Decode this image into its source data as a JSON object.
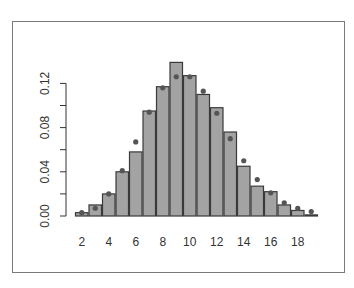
{
  "chart_data": {
    "type": "bar",
    "title": "",
    "xlabel": "",
    "ylabel": "",
    "categories": [
      2,
      3,
      4,
      5,
      6,
      7,
      8,
      9,
      10,
      11,
      12,
      13,
      14,
      15,
      16,
      17,
      18,
      19
    ],
    "series": [
      {
        "name": "observed",
        "kind": "bar",
        "values": [
          0.003,
          0.01,
          0.02,
          0.04,
          0.058,
          0.095,
          0.117,
          0.139,
          0.127,
          0.11,
          0.098,
          0.076,
          0.045,
          0.027,
          0.022,
          0.01,
          0.005,
          0.001
        ]
      },
      {
        "name": "expected",
        "kind": "point",
        "values": [
          0.003,
          0.007,
          0.02,
          0.041,
          0.067,
          0.094,
          0.116,
          0.126,
          0.126,
          0.113,
          0.093,
          0.07,
          0.05,
          0.033,
          0.021,
          0.012,
          0.007,
          0.004
        ]
      }
    ],
    "x_tick_labels": [
      "2",
      "4",
      "6",
      "8",
      "10",
      "12",
      "14",
      "16",
      "18"
    ],
    "y_tick_labels": [
      "0.00",
      "0.04",
      "0.08",
      "0.12"
    ],
    "y_minor_ticks": [
      0.0,
      0.02,
      0.04,
      0.06,
      0.08,
      0.1,
      0.12
    ],
    "ylim": [
      0,
      0.14
    ],
    "grid": false,
    "legend": "none",
    "colors": {
      "bar_fill": "#a3a3a3",
      "bar_stroke": "#3a3a3a",
      "point": "#555555",
      "frame": "#7a7a7a",
      "axis": "#333333"
    }
  }
}
